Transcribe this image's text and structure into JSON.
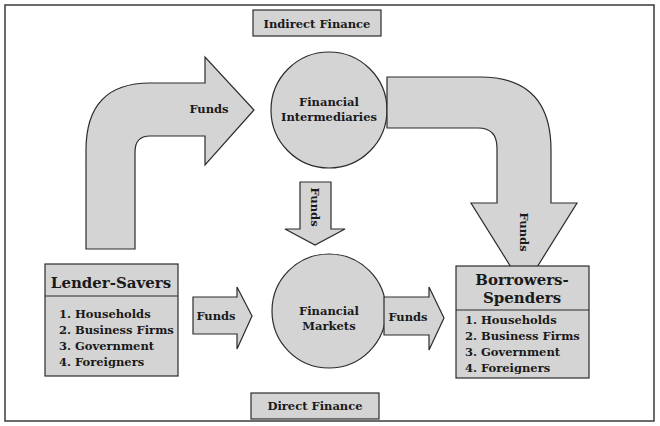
{
  "diagram": {
    "title_top": "Indirect Finance",
    "title_bottom": "Direct Finance",
    "nodes": {
      "intermediaries": {
        "line1": "Financial",
        "line2": "Intermediaries"
      },
      "markets": {
        "line1": "Financial",
        "line2": "Markets"
      },
      "lenders": {
        "title": "Lender-Savers",
        "items": [
          "1. Households",
          "2. Business Firms",
          "3. Government",
          "4. Foreigners"
        ]
      },
      "borrowers": {
        "title_line1": "Borrowers-",
        "title_line2": "Spenders",
        "items": [
          "1. Households",
          "2. Business Firms",
          "3. Government",
          "4. Foreigners"
        ]
      }
    },
    "arrows": {
      "lenders_to_intermediaries": "Funds",
      "intermediaries_to_borrowers": "Funds",
      "intermediaries_to_markets": "Funds",
      "lenders_to_markets": "Funds",
      "markets_to_borrowers": "Funds"
    },
    "colors": {
      "fill": "#d4d4d4",
      "stroke": "#2b2b2b",
      "background": "#ffffff"
    }
  }
}
